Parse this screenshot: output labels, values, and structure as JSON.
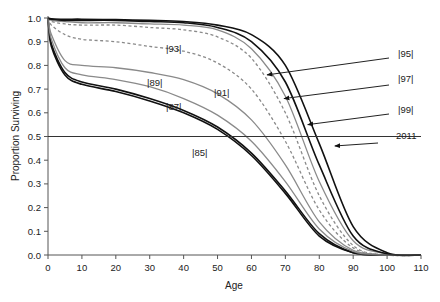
{
  "chart_data": {
    "type": "line",
    "title": "",
    "xlabel": "Age",
    "ylabel": "Proportion Surviving",
    "xlim": [
      0,
      110
    ],
    "ylim": [
      0.0,
      1.0
    ],
    "x_ticks": [
      "0",
      "10",
      "20",
      "30",
      "40",
      "50",
      "60",
      "70",
      "80",
      "90",
      "100",
      "110"
    ],
    "y_ticks": [
      "0.0",
      "0.1",
      "0.2",
      "0.3",
      "0.4",
      "0.5",
      "0.6",
      "0.7",
      "0.8",
      "0.9",
      "1.0"
    ],
    "grid": false,
    "reference_line": {
      "y": 0.5
    },
    "x": [
      0,
      1,
      5,
      10,
      20,
      30,
      40,
      50,
      60,
      70,
      80,
      90,
      100,
      110
    ],
    "series": [
      {
        "name": "|85|",
        "color": "#111111",
        "dash": false,
        "values": [
          1.0,
          0.88,
          0.76,
          0.72,
          0.69,
          0.65,
          0.6,
          0.53,
          0.42,
          0.26,
          0.08,
          0.01,
          0.0,
          0.0
        ]
      },
      {
        "name": "|87|",
        "color": "#111111",
        "dash": false,
        "values": [
          1.0,
          0.89,
          0.77,
          0.73,
          0.7,
          0.66,
          0.61,
          0.54,
          0.43,
          0.27,
          0.09,
          0.01,
          0.0,
          0.0
        ]
      },
      {
        "name": "|89|",
        "color": "#8a8a8a",
        "dash": false,
        "values": [
          1.0,
          0.91,
          0.79,
          0.76,
          0.74,
          0.71,
          0.66,
          0.59,
          0.48,
          0.31,
          0.11,
          0.015,
          0.0,
          0.0
        ]
      },
      {
        "name": "|91|",
        "color": "#8a8a8a",
        "dash": false,
        "values": [
          1.0,
          0.93,
          0.82,
          0.8,
          0.79,
          0.77,
          0.74,
          0.68,
          0.57,
          0.38,
          0.14,
          0.02,
          0.0,
          0.0
        ]
      },
      {
        "name": "|93|",
        "color": "#8a8a8a",
        "dash": true,
        "values": [
          1.0,
          0.97,
          0.93,
          0.91,
          0.9,
          0.88,
          0.86,
          0.81,
          0.7,
          0.48,
          0.19,
          0.03,
          0.0,
          0.0
        ]
      },
      {
        "name": "|95|",
        "color": "#8a8a8a",
        "dash": true,
        "values": [
          1.0,
          0.985,
          0.975,
          0.97,
          0.97,
          0.96,
          0.95,
          0.92,
          0.83,
          0.6,
          0.25,
          0.04,
          0.0,
          0.0
        ]
      },
      {
        "name": "|97|",
        "color": "#8a8a8a",
        "dash": false,
        "values": [
          1.0,
          0.99,
          0.985,
          0.98,
          0.98,
          0.975,
          0.97,
          0.95,
          0.87,
          0.67,
          0.31,
          0.06,
          0.005,
          0.0
        ]
      },
      {
        "name": "|99|",
        "color": "#111111",
        "dash": false,
        "values": [
          1.0,
          0.995,
          0.99,
          0.99,
          0.99,
          0.985,
          0.98,
          0.96,
          0.9,
          0.73,
          0.38,
          0.08,
          0.005,
          0.0
        ]
      },
      {
        "name": "2011",
        "color": "#111111",
        "dash": false,
        "values": [
          1.0,
          0.997,
          0.995,
          0.995,
          0.993,
          0.99,
          0.985,
          0.97,
          0.93,
          0.8,
          0.47,
          0.12,
          0.01,
          0.0
        ]
      }
    ],
    "annotations": [
      {
        "text": "|93|",
        "x": 33,
        "y": 0.89
      },
      {
        "text": "|89|",
        "x": 32,
        "y": 0.66
      },
      {
        "text": "|91|",
        "x": 52,
        "y": 0.63
      },
      {
        "text": "|87|",
        "x": 37,
        "y": 0.59
      },
      {
        "text": "|85|",
        "x": 46,
        "y": 0.44
      },
      {
        "text": "|95|",
        "arrow_to": {
          "x": 64,
          "y": 0.76
        }
      },
      {
        "text": "|97|",
        "arrow_to": {
          "x": 69,
          "y": 0.66
        }
      },
      {
        "text": "|99|",
        "arrow_to": {
          "x": 76,
          "y": 0.55
        }
      },
      {
        "text": "2011",
        "arrow_to": {
          "x": 84,
          "y": 0.46
        }
      }
    ],
    "legend_position": "none (inline labels)"
  }
}
